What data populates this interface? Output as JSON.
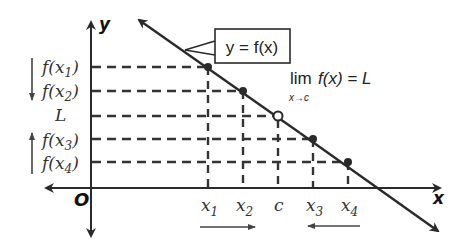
{
  "diagram": {
    "axes": {
      "x_label": "x",
      "y_label": "y",
      "origin_label": "O"
    },
    "curve_label": "y = f(x)",
    "limit_expression": {
      "main": "lim f(x) = L",
      "lim": "lim",
      "fx": "f(x) = L",
      "subscript": "x→c"
    },
    "y_labels": [
      {
        "text": "f(x",
        "sub": "1",
        "close": ")"
      },
      {
        "text": "f(x",
        "sub": "2",
        "close": ")"
      },
      {
        "text": "L"
      },
      {
        "text": "f(x",
        "sub": "3",
        "close": ")"
      },
      {
        "text": "f(x",
        "sub": "4",
        "close": ")"
      }
    ],
    "x_labels": [
      {
        "text": "x",
        "sub": "1"
      },
      {
        "text": "x",
        "sub": "2"
      },
      {
        "text": "c"
      },
      {
        "text": "x",
        "sub": "3"
      },
      {
        "text": "x",
        "sub": "4"
      }
    ],
    "arrows": {
      "y_left_top": "down",
      "y_left_bottom": "up",
      "x_bottom_left": "right",
      "x_bottom_right": "left"
    },
    "points": [
      {
        "name": "x1",
        "filled": true
      },
      {
        "name": "x2",
        "filled": true
      },
      {
        "name": "c",
        "filled": false
      },
      {
        "name": "x3",
        "filled": true
      },
      {
        "name": "x4",
        "filled": true
      }
    ],
    "colors": {
      "line": "#2a2a2a",
      "dash": "#333333",
      "text": "#333333"
    }
  }
}
